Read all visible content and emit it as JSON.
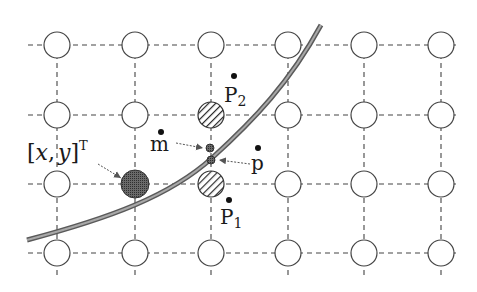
{
  "diagram": {
    "type": "pixel-grid-curve-interpolation",
    "grid": {
      "columns_x": [
        57,
        135,
        211,
        288,
        364,
        441
      ],
      "rows_y": [
        45,
        115,
        184,
        253
      ],
      "node_radius": 13,
      "line_style": "dashed",
      "line_color": "#333333"
    },
    "special_nodes": [
      {
        "id": "xy-node",
        "col": 1,
        "row": 2,
        "style": "filled-dark",
        "color": "#555555"
      },
      {
        "id": "p2-node",
        "col": 2,
        "row": 1,
        "style": "hatched"
      },
      {
        "id": "p1-node",
        "col": 2,
        "row": 2,
        "style": "hatched"
      }
    ],
    "curve": {
      "color": "#7a7a7a",
      "path": "M 27 240 C 120 215, 175 190, 212 158 S 290 80, 321 25"
    },
    "labels": {
      "xy": {
        "text_open": "[",
        "x": "x",
        "comma": ",",
        "y": "y",
        "text_close": "]",
        "superscript": "T"
      },
      "m": "m",
      "p": "p",
      "p1": {
        "base": "P",
        "sub": "1"
      },
      "p2": {
        "base": "P",
        "sub": "2"
      }
    },
    "points": {
      "m_point": {
        "x": 210,
        "y": 148
      },
      "p_tilde_point": {
        "x": 211,
        "y": 160
      }
    }
  }
}
